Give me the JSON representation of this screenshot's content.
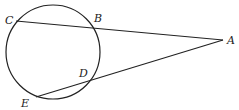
{
  "diagram": {
    "type": "geometry-secants",
    "circle": {
      "cx": 53,
      "cy": 52,
      "r": 47
    },
    "points": {
      "A": {
        "label": "A",
        "x": 223,
        "y": 40,
        "lx": 227,
        "ly": 44
      },
      "B": {
        "label": "B",
        "x": 92,
        "y": 27,
        "lx": 94,
        "ly": 22
      },
      "C": {
        "label": "C",
        "x": 16,
        "y": 21,
        "lx": 5,
        "ly": 24
      },
      "D": {
        "label": "D",
        "x": 91,
        "y": 79,
        "lx": 79,
        "ly": 77
      },
      "E": {
        "label": "E",
        "x": 36,
        "y": 97,
        "lx": 21,
        "ly": 107
      }
    },
    "segments": [
      {
        "from": "C",
        "to": "A"
      },
      {
        "from": "E",
        "to": "A"
      }
    ]
  }
}
